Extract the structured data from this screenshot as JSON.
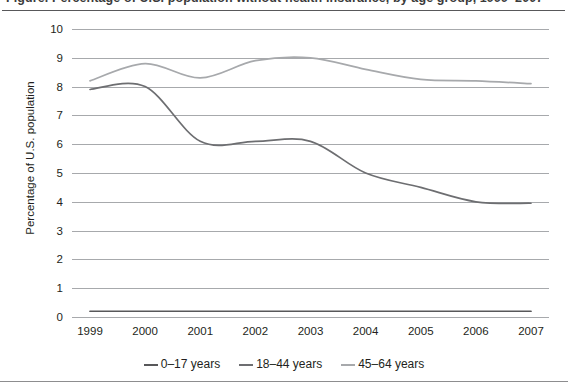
{
  "figure": {
    "title_cropped": "Figure. Percentage of U.S. population without health insurance, by age group, 1999–2007",
    "y_axis_label": "Percentage of U.S. population"
  },
  "chart_data": {
    "type": "line",
    "title": "",
    "xlabel": "",
    "ylabel": "Percentage of U.S. population",
    "x": [
      "1999",
      "2000",
      "2001",
      "2002",
      "2003",
      "2004",
      "2005",
      "2006",
      "2007"
    ],
    "xtick_labels": [
      "1999",
      "2000",
      "2001",
      "2002",
      "2003",
      "2004",
      "2005",
      "2006",
      "2007"
    ],
    "ytick_labels": [
      "0",
      "1",
      "2",
      "3",
      "4",
      "5",
      "6",
      "7",
      "8",
      "9",
      "10"
    ],
    "ylim": [
      0,
      10
    ],
    "ytick_step": 1,
    "grid": "horizontal",
    "legend_position": "bottom",
    "smoothed": true,
    "series": [
      {
        "name": "0–17 years",
        "color": "#58585a",
        "values": [
          0.2,
          0.2,
          0.2,
          0.2,
          0.2,
          0.2,
          0.2,
          0.2,
          0.2
        ]
      },
      {
        "name": "18–44 years",
        "color": "#6d6e71",
        "values": [
          7.9,
          8.0,
          6.1,
          6.1,
          6.1,
          5.0,
          4.5,
          4.0,
          3.95
        ]
      },
      {
        "name": "45–64 years",
        "color": "#a7a9ac",
        "values": [
          8.2,
          8.8,
          8.3,
          8.9,
          9.0,
          8.6,
          8.25,
          8.2,
          8.1
        ]
      }
    ]
  },
  "legend": {
    "items": [
      {
        "label": "0–17 years",
        "color": "#58585a"
      },
      {
        "label": "18–44 years",
        "color": "#6d6e71"
      },
      {
        "label": "45–64 years",
        "color": "#a7a9ac"
      }
    ]
  }
}
